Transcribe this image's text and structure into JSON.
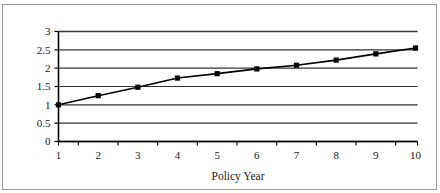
{
  "figure": {
    "background_color": "#ffffff",
    "frame_color": "#9a9a9a",
    "line_color": "#000000",
    "grid_color": "#333333",
    "clipped_title_fragment": ""
  },
  "chart_data": {
    "type": "line",
    "title": "",
    "xlabel": "Policy Year",
    "ylabel": "",
    "x": [
      1,
      2,
      3,
      4,
      5,
      6,
      7,
      8,
      9,
      10
    ],
    "values": [
      1.0,
      1.25,
      1.48,
      1.73,
      1.85,
      1.98,
      2.08,
      2.22,
      2.39,
      2.55
    ],
    "series": [
      {
        "name": "",
        "values": [
          1.0,
          1.25,
          1.48,
          1.73,
          1.85,
          1.98,
          2.08,
          2.22,
          2.39,
          2.55
        ],
        "marker": "square",
        "marker_color": "#000000",
        "line_color": "#000000"
      }
    ],
    "xlim": [
      1,
      10
    ],
    "ylim": [
      0,
      3
    ],
    "ytick_labels": [
      "0",
      "0.5",
      "1",
      "1.5",
      "2",
      "2.5",
      "3"
    ],
    "ytick_values": [
      0,
      0.5,
      1,
      1.5,
      2,
      2.5,
      3
    ],
    "xtick_labels": [
      "1",
      "2",
      "3",
      "4",
      "5",
      "6",
      "7",
      "8",
      "9",
      "10"
    ],
    "xtick_values": [
      1,
      2,
      3,
      4,
      5,
      6,
      7,
      8,
      9,
      10
    ],
    "grid": "horizontal",
    "legend": "none"
  }
}
